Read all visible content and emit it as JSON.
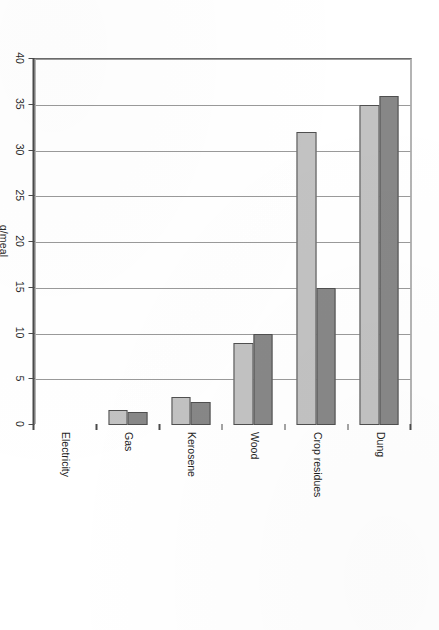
{
  "figure": {
    "axis_title": "g/meal",
    "caption_fragment": "",
    "colors": {
      "series_a": "#878787",
      "series_b": "#c2c2c2",
      "frame": "#6b6b6b",
      "gridline": "#9a9a9a",
      "axis": "#4a4a4a",
      "background": "#ffffff"
    }
  },
  "chart_data": {
    "type": "bar",
    "orientation": "horizontal",
    "title": "",
    "subtitle": "",
    "xlabel": "",
    "ylabel": "g/meal",
    "value_axis_label": "g/meal",
    "categories": [
      "Dung",
      "Crop residues",
      "Wood",
      "Kerosene",
      "Gas",
      "Electricity"
    ],
    "series": [
      {
        "name": "Series 1",
        "color": "#878787",
        "values": [
          36.0,
          15.0,
          10.0,
          2.5,
          1.4,
          0.0
        ]
      },
      {
        "name": "Series 2",
        "color": "#c2c2c2",
        "values": [
          35.0,
          32.0,
          9.0,
          3.1,
          1.6,
          0.0
        ]
      }
    ],
    "value_ticks": [
      0,
      5,
      10,
      15,
      20,
      25,
      30,
      35,
      40
    ],
    "value_tick_labels": [
      "0",
      "5",
      "10",
      "15",
      "20",
      "25",
      "30",
      "35",
      "40"
    ],
    "ylim": [
      0,
      40
    ],
    "grid": true,
    "grid_axis": "value",
    "legend": false,
    "legend_position": "none",
    "axis_direction": "value axis increases right-to-left; 0 at the category axis"
  }
}
